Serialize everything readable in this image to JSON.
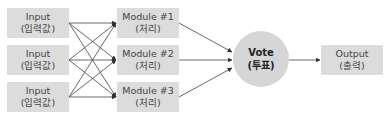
{
  "inputs": [
    {
      "title": "Input",
      "subtitle": "(입력값)"
    },
    {
      "title": "Input",
      "subtitle": "(입력값)"
    },
    {
      "title": "Input",
      "subtitle": "(입력값)"
    }
  ],
  "modules": [
    {
      "title": "Module #1",
      "subtitle": "(처리)"
    },
    {
      "title": "Module #2",
      "subtitle": "(처리)"
    },
    {
      "title": "Module #3",
      "subtitle": "(처리)"
    }
  ],
  "vote": {
    "title": "Vote",
    "subtitle": "(투표)"
  },
  "output": {
    "title": "Output",
    "subtitle": "(출력)"
  },
  "colors": {
    "box_fill": "#dcdcdc",
    "circle_fill": "#d6d6d6",
    "arrow": "#333333"
  }
}
